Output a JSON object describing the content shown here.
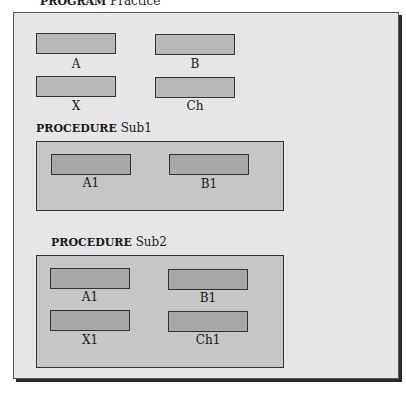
{
  "program": {
    "keyword": "PROGRAM",
    "name": "Practice",
    "variables": [
      {
        "label": "A"
      },
      {
        "label": "B"
      },
      {
        "label": "X"
      },
      {
        "label": "Ch"
      }
    ]
  },
  "procedures": [
    {
      "keyword": "PROCEDURE",
      "name": "Sub1",
      "variables": [
        {
          "label": "A1"
        },
        {
          "label": "B1"
        }
      ]
    },
    {
      "keyword": "PROCEDURE",
      "name": "Sub2",
      "variables": [
        {
          "label": "A1"
        },
        {
          "label": "B1"
        },
        {
          "label": "X1"
        },
        {
          "label": "Ch1"
        }
      ]
    }
  ],
  "colors": {
    "outer_fill": "#e6e6e6",
    "procedure_fill": "#c6c6c6",
    "variable_fill": "#b9b9b9",
    "border": "#333333"
  }
}
